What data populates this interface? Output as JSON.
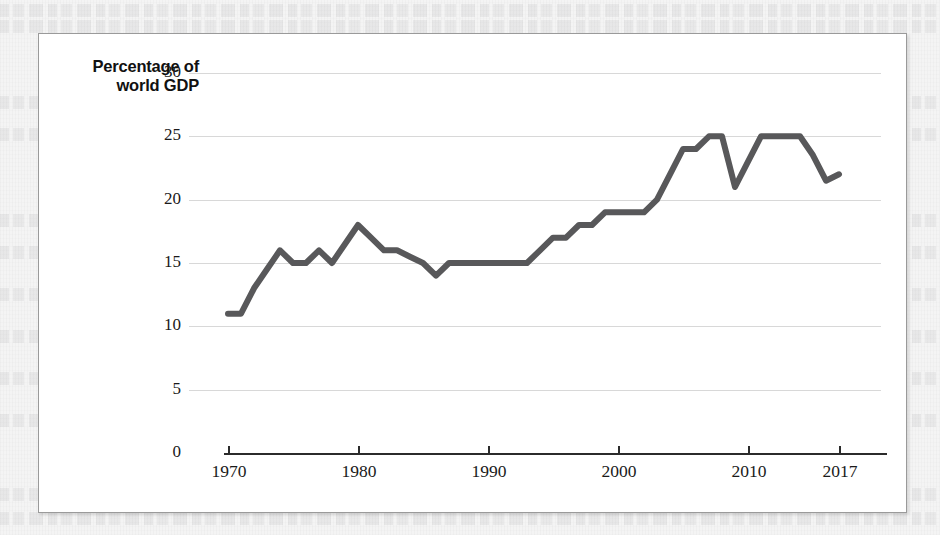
{
  "card": {
    "background_color": "#ffffff",
    "border_color": "#9a9a9a"
  },
  "page": {
    "background_color": "#f4f4f4"
  },
  "chart_data": {
    "type": "line",
    "title": "",
    "subtitle": "",
    "ylabel": "Percentage of world GDP",
    "ylabel_line1": "Percentage of",
    "ylabel_line2": "world GDP",
    "xlabel": "",
    "xlim": [
      1970,
      2017
    ],
    "ylim": [
      0,
      30
    ],
    "ytick_labels": [
      "30",
      "25",
      "20",
      "15",
      "10",
      "5",
      "0"
    ],
    "ytick_values": [
      30,
      25,
      20,
      15,
      10,
      5,
      0
    ],
    "xtick_labels": [
      "1970",
      "1980",
      "1990",
      "2000",
      "2010",
      "2017"
    ],
    "xtick_values": [
      1970,
      1980,
      1990,
      2000,
      2010,
      2017
    ],
    "grid": "horizontal",
    "legend": "none",
    "series_color": "#58585a",
    "gridline_color": "#d8d8d8",
    "axis_color": "#2b2b2b",
    "series": [
      {
        "name": "Percentage of world GDP",
        "x": [
          1970,
          1971,
          1972,
          1973,
          1974,
          1975,
          1976,
          1977,
          1978,
          1979,
          1980,
          1981,
          1982,
          1983,
          1984,
          1985,
          1986,
          1987,
          1988,
          1989,
          1990,
          1991,
          1992,
          1993,
          1994,
          1995,
          1996,
          1997,
          1998,
          1999,
          2000,
          2001,
          2002,
          2003,
          2004,
          2005,
          2006,
          2007,
          2008,
          2009,
          2010,
          2011,
          2012,
          2013,
          2014,
          2015,
          2016,
          2017
        ],
        "values": [
          11,
          11,
          13,
          14.5,
          16,
          15,
          15,
          16,
          15,
          16.5,
          18,
          17,
          16,
          16,
          15.5,
          15,
          14,
          15,
          15,
          15,
          15,
          15,
          15,
          15,
          16,
          17,
          17,
          18,
          18,
          19,
          19,
          19,
          19,
          20,
          22,
          24,
          24,
          25,
          25,
          21,
          23,
          25,
          25,
          25,
          25,
          23.5,
          21.5,
          22
        ]
      }
    ]
  }
}
